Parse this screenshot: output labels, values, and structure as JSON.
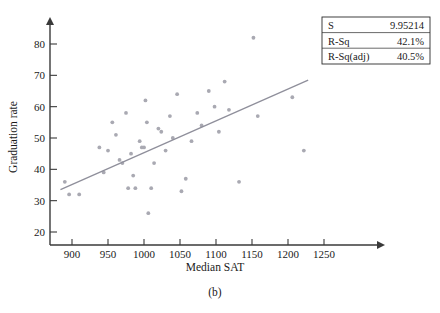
{
  "figure": {
    "caption": "(b)"
  },
  "chart_data": {
    "type": "scatter",
    "title": "",
    "xlabel": "Median SAT",
    "ylabel": "Graduation rate",
    "xlim": [
      880,
      1265
    ],
    "ylim": [
      17,
      85
    ],
    "xticks": [
      900,
      950,
      1000,
      1050,
      1100,
      1150,
      1200,
      1250
    ],
    "yticks": [
      20,
      30,
      40,
      50,
      60,
      70,
      80
    ],
    "grid": false,
    "legend": "none",
    "points": [
      {
        "x": 890,
        "y": 36
      },
      {
        "x": 896,
        "y": 32
      },
      {
        "x": 910,
        "y": 32
      },
      {
        "x": 938,
        "y": 47
      },
      {
        "x": 944,
        "y": 39
      },
      {
        "x": 950,
        "y": 46
      },
      {
        "x": 956,
        "y": 55
      },
      {
        "x": 961,
        "y": 51
      },
      {
        "x": 966,
        "y": 43
      },
      {
        "x": 970,
        "y": 42
      },
      {
        "x": 975,
        "y": 58
      },
      {
        "x": 978,
        "y": 34
      },
      {
        "x": 982,
        "y": 45
      },
      {
        "x": 985,
        "y": 38
      },
      {
        "x": 988,
        "y": 34
      },
      {
        "x": 994,
        "y": 49
      },
      {
        "x": 997,
        "y": 47
      },
      {
        "x": 1000,
        "y": 47
      },
      {
        "x": 1002,
        "y": 62
      },
      {
        "x": 1004,
        "y": 55
      },
      {
        "x": 1006,
        "y": 26
      },
      {
        "x": 1010,
        "y": 34
      },
      {
        "x": 1014,
        "y": 42
      },
      {
        "x": 1020,
        "y": 53
      },
      {
        "x": 1024,
        "y": 52
      },
      {
        "x": 1030,
        "y": 46
      },
      {
        "x": 1036,
        "y": 57
      },
      {
        "x": 1040,
        "y": 50
      },
      {
        "x": 1046,
        "y": 64
      },
      {
        "x": 1052,
        "y": 33
      },
      {
        "x": 1058,
        "y": 37
      },
      {
        "x": 1066,
        "y": 49
      },
      {
        "x": 1074,
        "y": 58
      },
      {
        "x": 1080,
        "y": 54
      },
      {
        "x": 1090,
        "y": 65
      },
      {
        "x": 1098,
        "y": 60
      },
      {
        "x": 1104,
        "y": 52
      },
      {
        "x": 1112,
        "y": 68
      },
      {
        "x": 1118,
        "y": 59
      },
      {
        "x": 1132,
        "y": 36
      },
      {
        "x": 1152,
        "y": 82
      },
      {
        "x": 1158,
        "y": 57
      },
      {
        "x": 1206,
        "y": 63
      },
      {
        "x": 1222,
        "y": 46
      }
    ],
    "fit_line": {
      "x1": 884,
      "y1": 33.5,
      "x2": 1228,
      "y2": 68.5
    },
    "annotations": {
      "stats": [
        {
          "label": "S",
          "value": "9.95214"
        },
        {
          "label": "R-Sq",
          "value": "42.1%"
        },
        {
          "label": "R-Sq(adj)",
          "value": "40.5%"
        }
      ]
    }
  }
}
